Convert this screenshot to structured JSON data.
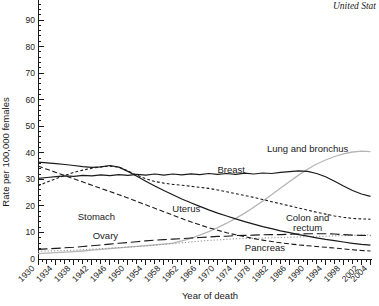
{
  "title": "United Stat",
  "chart_data": {
    "type": "line",
    "title": "United Stat",
    "xlabel": "Year of death",
    "ylabel": "Rate per 100,000 females",
    "xlim": [
      1930,
      2004
    ],
    "ylim": [
      0,
      97.5
    ],
    "grid": false,
    "legend_position": "inline-labels",
    "x_start": 1930,
    "x_step": 2,
    "x_tick_labels": [
      1930,
      1934,
      1938,
      1942,
      1946,
      1950,
      1954,
      1958,
      1962,
      1966,
      1970,
      1974,
      1978,
      1982,
      1986,
      1990,
      1994,
      1998,
      2002,
      2004
    ],
    "y_tick_step": 10,
    "y_minor_step": 2,
    "x_minor_step": 1,
    "series": [
      {
        "name": "Lung and bronchus",
        "style": "solid",
        "color": "#b5b5b5",
        "width": 1.3,
        "label": {
          "text": "Lung and bronchus",
          "year": 1990,
          "value": 41.5
        },
        "values": [
          2.0,
          2.2,
          2.4,
          2.6,
          2.8,
          3.0,
          3.3,
          3.6,
          3.9,
          4.2,
          4.5,
          4.8,
          5.0,
          5.3,
          5.6,
          6.0,
          6.8,
          7.8,
          9.0,
          10.3,
          11.8,
          13.5,
          15.3,
          17.3,
          19.5,
          21.8,
          24.2,
          26.7,
          29.2,
          31.6,
          33.8,
          35.8,
          37.3,
          38.6,
          39.6,
          40.3,
          40.6,
          40.4
        ]
      },
      {
        "name": "Pancreas",
        "style": "dotted",
        "color": "#8c8c8c",
        "width": 1.0,
        "label": {
          "text": "Pancreas",
          "year": 1980.5,
          "value": 4.2
        },
        "values": [
          2.9,
          3.0,
          3.1,
          3.2,
          3.3,
          3.5,
          3.7,
          3.9,
          4.1,
          4.3,
          4.5,
          4.7,
          4.9,
          5.2,
          5.5,
          5.8,
          6.1,
          6.4,
          6.7,
          7.0,
          7.2,
          7.4,
          7.6,
          7.7,
          7.8,
          7.9,
          8.0,
          8.1,
          8.2,
          8.3,
          8.4,
          8.5,
          8.6,
          8.7,
          8.8,
          8.9,
          9.0,
          9.1
        ]
      },
      {
        "name": "Ovary",
        "style": "long-dash",
        "color": "#1a1a1a",
        "width": 1.1,
        "label": {
          "text": "Ovary",
          "year": 1945,
          "value": 8.7
        },
        "values": [
          3.6,
          3.8,
          4.0,
          4.2,
          4.4,
          4.7,
          5.0,
          5.3,
          5.6,
          5.9,
          6.2,
          6.5,
          6.8,
          7.1,
          7.3,
          7.5,
          7.7,
          7.9,
          8.1,
          8.3,
          8.5,
          8.6,
          8.8,
          8.9,
          9.0,
          9.1,
          9.2,
          9.2,
          9.3,
          9.4,
          9.5,
          9.5,
          9.5,
          9.4,
          9.2,
          9.0,
          8.9,
          8.8
        ]
      },
      {
        "name": "Stomach",
        "style": "dashed",
        "color": "#1a1a1a",
        "width": 1.1,
        "label": {
          "text": "Stomach",
          "year": 1943,
          "value": 16
        },
        "values": [
          35.0,
          33.8,
          32.6,
          31.4,
          30.2,
          29.0,
          27.8,
          26.6,
          25.4,
          24.2,
          23.0,
          21.7,
          20.4,
          19.1,
          17.8,
          16.5,
          15.2,
          14.0,
          12.9,
          11.8,
          10.8,
          9.9,
          9.1,
          8.4,
          7.7,
          7.1,
          6.6,
          6.1,
          5.7,
          5.3,
          5.0,
          4.7,
          4.4,
          4.1,
          3.8,
          3.5,
          3.2,
          3.0
        ]
      },
      {
        "name": "Colon and rectum",
        "style": "short-dash",
        "color": "#1a1a1a",
        "width": 1.1,
        "label": {
          "lines": [
            "Colon and",
            "rectum"
          ],
          "year": 1990,
          "value": 13.5
        },
        "values": [
          27.5,
          29.0,
          30.3,
          31.5,
          32.6,
          33.5,
          34.2,
          34.7,
          35.0,
          34.6,
          33.2,
          31.6,
          30.2,
          29.2,
          28.6,
          28.1,
          27.8,
          27.4,
          27.0,
          26.6,
          26.0,
          25.3,
          24.6,
          23.9,
          23.2,
          22.4,
          21.6,
          20.8,
          20.0,
          19.2,
          18.4,
          17.6,
          16.9,
          16.2,
          15.7,
          15.3,
          15.1,
          15.0
        ]
      },
      {
        "name": "Uterus",
        "style": "solid",
        "color": "#1a1a1a",
        "width": 1.2,
        "label": {
          "text": "Uterus",
          "year": 1963,
          "value": 19
        },
        "values": [
          36.5,
          36.2,
          35.9,
          35.6,
          35.2,
          34.8,
          34.5,
          34.7,
          35.2,
          34.6,
          33.0,
          31.2,
          29.3,
          27.5,
          25.8,
          24.2,
          22.6,
          21.2,
          19.8,
          18.5,
          17.3,
          16.2,
          15.1,
          14.1,
          13.1,
          12.2,
          11.4,
          10.6,
          9.9,
          9.2,
          8.6,
          8.0,
          7.4,
          6.9,
          6.4,
          5.9,
          5.5,
          5.2
        ]
      },
      {
        "name": "Breast",
        "style": "solid",
        "color": "#1a1a1a",
        "width": 1.2,
        "label": {
          "text": "Breast",
          "year": 1973,
          "value": 33.5
        },
        "values": [
          30.4,
          30.7,
          31.0,
          31.3,
          31.1,
          31.5,
          31.3,
          31.7,
          31.4,
          31.8,
          31.5,
          31.9,
          31.6,
          32.0,
          31.6,
          32.0,
          31.7,
          32.1,
          31.8,
          32.2,
          31.9,
          32.2,
          31.9,
          32.3,
          32.0,
          32.4,
          32.2,
          32.6,
          32.9,
          33.2,
          33.0,
          32.2,
          31.0,
          29.3,
          27.5,
          25.8,
          24.5,
          23.6
        ]
      }
    ]
  }
}
